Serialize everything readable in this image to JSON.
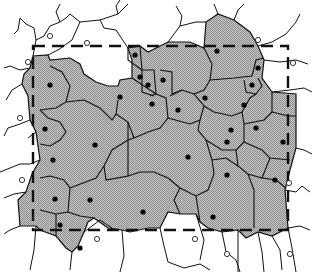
{
  "diagram": {
    "type": "voronoi-tessellation",
    "colors": {
      "background": "#ffffff",
      "cell_fill": "#b4b4b4",
      "cell_edge": "#111111",
      "dashed_window": "#111111",
      "seed_filled": "#000000",
      "seed_open_stroke": "#333333"
    },
    "dashed_window": {
      "x": 33,
      "y": 46,
      "width": 255,
      "height": 184
    },
    "filled_seeds": [
      [
        50,
        85
      ],
      [
        45,
        129
      ],
      [
        53,
        160
      ],
      [
        55,
        199
      ],
      [
        60,
        225
      ],
      [
        95,
        145
      ],
      [
        90,
        200
      ],
      [
        135,
        55
      ],
      [
        140,
        77
      ],
      [
        148,
        85
      ],
      [
        163,
        80
      ],
      [
        152,
        104
      ],
      [
        178,
        110
      ],
      [
        205,
        98
      ],
      [
        217,
        51
      ],
      [
        258,
        68
      ],
      [
        252,
        85
      ],
      [
        244,
        105
      ],
      [
        227,
        142
      ],
      [
        256,
        128
      ],
      [
        283,
        142
      ],
      [
        275,
        180
      ],
      [
        227,
        175
      ],
      [
        143,
        212
      ],
      [
        213,
        217
      ],
      [
        188,
        157
      ],
      [
        120,
        97
      ],
      [
        231,
        130
      ],
      [
        80,
        248
      ]
    ],
    "open_seeds": [
      [
        50,
        36
      ],
      [
        87,
        43
      ],
      [
        28,
        62
      ],
      [
        20,
        118
      ],
      [
        22,
        180
      ],
      [
        258,
        40
      ],
      [
        293,
        63
      ],
      [
        289,
        183
      ],
      [
        97,
        239
      ],
      [
        195,
        239
      ],
      [
        227,
        254
      ],
      [
        290,
        254
      ]
    ]
  }
}
